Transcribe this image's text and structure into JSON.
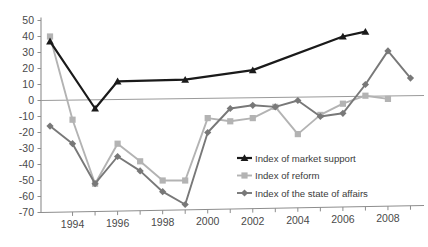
{
  "chart_data": {
    "type": "line",
    "title": "",
    "subtitle": "",
    "xlabel": "",
    "ylabel": "",
    "x": [
      1993,
      1994,
      1995,
      1996,
      1997,
      1998,
      1999,
      2000,
      2001,
      2002,
      2003,
      2004,
      2005,
      2006,
      2007,
      2008,
      2009
    ],
    "xlim": [
      1992.6,
      2009.6
    ],
    "ylim": [
      -70,
      50
    ],
    "ytick_labels": [
      "50",
      "40",
      "30",
      "20",
      "10",
      "0",
      "-10",
      "-20",
      "-30",
      "-40",
      "-50",
      "-60",
      "-70"
    ],
    "yticks": [
      50,
      40,
      30,
      20,
      10,
      0,
      -10,
      -20,
      -30,
      -40,
      -50,
      -60,
      -70
    ],
    "xtick_labels": [
      "1994",
      "1996",
      "1998",
      "2000",
      "2002",
      "2004",
      "2006",
      "2008"
    ],
    "xticks": [
      1994,
      1996,
      1998,
      2000,
      2002,
      2004,
      2006,
      2008
    ],
    "grid": false,
    "zero_line": true,
    "legend_position": "inside-bottom-right",
    "series": [
      {
        "name": "Index of market support",
        "color": "#1a1a1a",
        "marker": "triangle",
        "x": [
          1993,
          1995,
          1996,
          1999,
          2002,
          2006,
          2007
        ],
        "values": [
          37,
          -5,
          12,
          13,
          19,
          40,
          43
        ]
      },
      {
        "name": "Index of reform",
        "color": "#b3b3b3",
        "marker": "square",
        "x": [
          1993,
          1994,
          1995,
          1996,
          1997,
          1998,
          1999,
          2000,
          2001,
          2002,
          2003,
          2004,
          2005,
          2006,
          2007,
          2008
        ],
        "values": [
          40,
          -12,
          -52,
          -27,
          -38,
          -50,
          -50,
          -11,
          -13,
          -11,
          -4,
          -21,
          -9,
          -2,
          3,
          1
        ]
      },
      {
        "name": "Index of the state of affairs",
        "color": "#787878",
        "marker": "diamond",
        "x": [
          1993,
          1994,
          1995,
          1996,
          1997,
          1998,
          1999,
          2000,
          2001,
          2002,
          2003,
          2004,
          2005,
          2006,
          2007,
          2008,
          2009
        ],
        "values": [
          -16,
          -27,
          -52,
          -35,
          -44,
          -57,
          -65,
          -20,
          -5,
          -3,
          -4,
          0,
          -10,
          -8,
          10,
          31,
          14
        ]
      }
    ]
  }
}
